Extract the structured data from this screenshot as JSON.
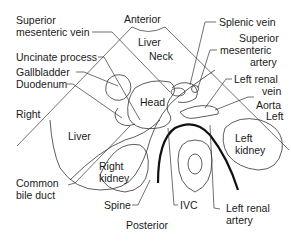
{
  "diagram": {
    "orientation": {
      "anterior": "Anterior",
      "posterior": "Posterior",
      "right": "Right",
      "left": "Left"
    },
    "left_labels": {
      "superior_mesenteric_vein": [
        "Superior",
        "mesenteric vein"
      ],
      "uncinate_process": "Uncinate process",
      "gallbladder": "Gallbladder",
      "duodenum": "Duodenum",
      "common_bile_duct": [
        "Common",
        "bile duct"
      ],
      "spine": "Spine"
    },
    "right_labels": {
      "splenic_vein": "Splenic vein",
      "superior_mesenteric_artery": [
        "Superior",
        "mesenteric",
        "artery"
      ],
      "left_renal_vein": [
        "Left renal",
        "vein"
      ],
      "aorta": "Aorta",
      "ivc": "IVC",
      "left_renal_artery": [
        "Left renal",
        "artery"
      ]
    },
    "region_labels": {
      "liver_top": "Liver",
      "neck": "Neck",
      "head": "Head",
      "liver_right": "Liver",
      "right_kidney": [
        "Right",
        "kidney"
      ],
      "left_kidney": [
        "Left",
        "kidney"
      ]
    }
  }
}
